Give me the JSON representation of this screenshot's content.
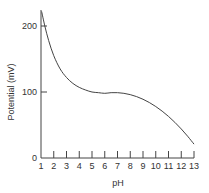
{
  "chart_data": {
    "type": "line",
    "title": "",
    "xlabel": "pH",
    "ylabel": "Potential (mV)",
    "xlim": [
      1,
      13
    ],
    "ylim": [
      0,
      225
    ],
    "x_ticks": [
      1,
      2,
      3,
      4,
      5,
      6,
      7,
      8,
      9,
      10,
      11,
      12,
      13
    ],
    "y_ticks": [
      0,
      100,
      200
    ],
    "grid": false,
    "legend": null,
    "series": [
      {
        "name": "Potential",
        "x": [
          1.05,
          1.3,
          1.6,
          2.0,
          2.5,
          3.0,
          3.5,
          4.0,
          4.5,
          5.0,
          5.5,
          6.0,
          6.5,
          7.0,
          7.5,
          8.0,
          8.5,
          9.0,
          9.5,
          10.0,
          10.5,
          11.0,
          11.5,
          12.0,
          12.5,
          13.0
        ],
        "values": [
          222,
          200,
          178,
          155,
          135,
          122,
          113,
          107,
          103,
          100,
          99,
          98,
          99,
          99,
          98,
          96,
          93,
          89,
          84,
          78,
          71,
          63,
          54,
          44,
          33,
          21
        ]
      }
    ]
  },
  "labels": {
    "xlabel": "pH",
    "ylabel": "Potential (mV)",
    "y_tick_labels": [
      "0",
      "100",
      "200"
    ],
    "x_tick_labels": [
      "1",
      "2",
      "3",
      "4",
      "5",
      "6",
      "7",
      "8",
      "9",
      "10",
      "11",
      "12",
      "13"
    ]
  },
  "colors": {
    "line": "#444444",
    "axis": "#444444",
    "text": "#333333"
  }
}
